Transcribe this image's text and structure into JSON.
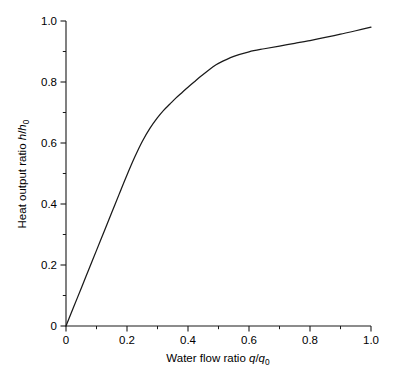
{
  "chart_data": {
    "type": "line",
    "title": "",
    "subtitle": "",
    "xlabel": "Water flow ratio q/q0",
    "ylabel": "Heat output ratio h/h0",
    "xlabel_parts": {
      "text": "Water flow ratio ",
      "var1": "q",
      "slash": "/",
      "var2": "q",
      "sub": "0"
    },
    "ylabel_parts": {
      "text": "Heat output ratio ",
      "var1": "h",
      "slash": "/",
      "var2": "h",
      "sub": "0"
    },
    "xlim": [
      0,
      1.0
    ],
    "ylim": [
      0,
      1.0
    ],
    "xticks": [
      0,
      0.2,
      0.4,
      0.6,
      0.8,
      1.0
    ],
    "xticklabels": [
      "0",
      "0.2",
      "0.4",
      "0.6",
      "0.8",
      "1.0"
    ],
    "yticks": [
      0,
      0.2,
      0.4,
      0.6,
      0.8,
      1.0
    ],
    "yticklabels": [
      "0",
      "0.2",
      "0.4",
      "0.6",
      "0.8",
      "1.0"
    ],
    "xminorticks": [
      0.1,
      0.3,
      0.5,
      0.7,
      0.9
    ],
    "yminorticks": [
      0.1,
      0.3,
      0.5,
      0.7,
      0.9
    ],
    "grid": false,
    "legend": false,
    "legend_position": "none",
    "line_color": "#1a1a1a",
    "background_color": "#ffffff",
    "series": [
      {
        "name": "heat output vs water flow",
        "x": [
          0.0,
          0.025,
          0.05,
          0.075,
          0.1,
          0.125,
          0.15,
          0.175,
          0.2,
          0.225,
          0.25,
          0.275,
          0.3,
          0.32,
          0.34,
          0.36,
          0.38,
          0.4,
          0.42,
          0.44,
          0.46,
          0.48,
          0.5,
          0.55,
          0.6,
          0.65,
          0.7,
          0.75,
          0.8,
          0.85,
          0.9,
          0.95,
          1.0
        ],
        "y": [
          0.0,
          0.062,
          0.124,
          0.186,
          0.248,
          0.31,
          0.372,
          0.434,
          0.495,
          0.553,
          0.605,
          0.648,
          0.683,
          0.707,
          0.727,
          0.747,
          0.765,
          0.783,
          0.8,
          0.817,
          0.833,
          0.848,
          0.861,
          0.884,
          0.899,
          0.909,
          0.918,
          0.927,
          0.936,
          0.946,
          0.957,
          0.968,
          0.98
        ]
      }
    ]
  },
  "axes": {
    "x_tick_count": 6,
    "y_tick_count": 6
  }
}
